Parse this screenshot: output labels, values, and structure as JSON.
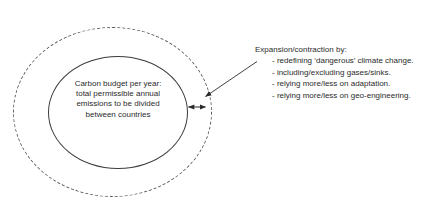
{
  "diagram": {
    "title_fragment": "",
    "outer_circle": {
      "name": "expanded-carbon-budget-boundary",
      "style": "dashed"
    },
    "inner_circle": {
      "name": "carbon-budget-boundary",
      "style": "solid"
    },
    "center_label": {
      "lines": [
        "Carbon budget per year:",
        "total permissible annual",
        "emissions to be divided",
        "between countries"
      ]
    },
    "gap_arrow": {
      "name": "expansion-contraction-double-arrow",
      "direction": "double"
    },
    "annotation": {
      "heading": "Expansion/contraction by:",
      "bullets": [
        "- redefining ‘dangerous’ climate change.",
        "- including/excluding gases/sinks.",
        "- relying more/less on adaptation.",
        "- relying more/less on geo-engineering."
      ]
    },
    "colors": {
      "background": "#ffffff",
      "text": "#2b2b2b",
      "stroke_solid": "#3c3c3c",
      "stroke_dashed": "#5a5a5a"
    }
  }
}
